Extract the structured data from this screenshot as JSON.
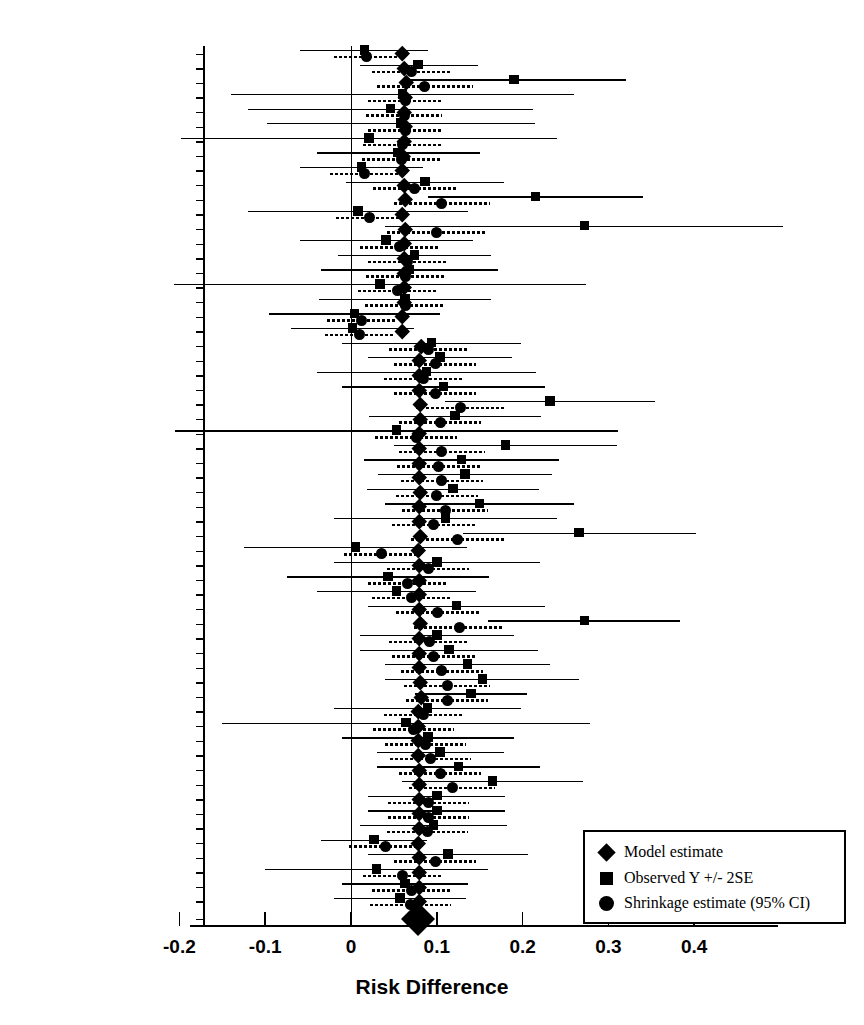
{
  "figure": {
    "type": "forest-plot",
    "xlabel": "Risk Difference"
  },
  "axis": {
    "ticks": [
      "-0.2",
      "-0.1",
      "0",
      "0.1",
      "0.2",
      "0.3",
      "0.4"
    ],
    "tick_values": [
      -0.2,
      -0.1,
      0,
      0.1,
      0.2,
      0.3,
      0.4
    ],
    "xlim": [
      -0.215,
      0.495
    ],
    "reference_line": 0
  },
  "legend": {
    "items": [
      {
        "marker": "diamond",
        "label": "Model estimate"
      },
      {
        "marker": "square",
        "label": "Observed Y +/- 2SE"
      },
      {
        "marker": "circle",
        "label": "Shrinkage estimate (95% CI)"
      }
    ]
  },
  "chart_data": {
    "type": "forest",
    "title": "",
    "xlabel": "Risk Difference",
    "ylabel": "",
    "xlim": [
      -0.215,
      0.495
    ],
    "grid": false,
    "legend_position": "bottom-right",
    "categories": [
      "BR THOR SOCIETY 1983",
      "RUSSELL 1983",
      "FAGERSTROM 1984",
      "JAMROZIK 1984",
      "JARVIK 1984",
      "CLAVEL-CHAPEL 1985",
      "SCHNEIDERa 1985",
      "PAGE 1986",
      "CAMPBELL 1987",
      "SUTTON 1987",
      "AREECHON 1988",
      "HARACKIEWICZ 1988",
      "LLIVINA 1988",
      "SUTTON 1988",
      "GILBERT 1989",
      "HUGHES 1989",
      "HUGHES 1990",
      "MORI 1992",
      "NEBOT 1992",
      "FORTMANN 1995",
      "PUSKA 1979",
      "MALCOLM 1980",
      "FAGERSTROM 1982",
      "FEE 1982",
      "JARVIS 1982",
      "HJALMARSON 1984",
      "KILLEN 1984",
      "SCHNEIDER 1985",
      "HALL 1987",
      "TONNESEN 1988",
      "BLONDAL 1989",
      "GARCIA 1989",
      "KILLEN 1990",
      "NAKAMURA 1990",
      "CAMPBELL 1991",
      "JENSEN 1991",
      "MCGOVERN 1992",
      "PIRIE 1992",
      "ZELMAN 1992",
      "HERRERA-1 1995",
      "ABELIN 1989",
      "DAUGHTON 1991",
      "TONNESEN 1991",
      "BURTON 1992",
      "PAOLETTI 1996",
      "BUCHKREMER 1981",
      "HURT 1990",
      "EHRSAM 1991",
      "TNSG 1991",
      "SACHS 1993",
      "WESTMAN 1993",
      "FIORE-1 1994",
      "FIORE-2 1994",
      "HURT 1994",
      "ICRF 1994",
      "RICHMOND 1994",
      "KORNITZER 1995",
      "STAPLETON 1995",
      "CAMPBELL 1996",
      "Overall"
    ],
    "series": [
      {
        "name": "Model estimate",
        "marker": "diamond",
        "values": [
          0.06,
          0.062,
          0.064,
          0.063,
          0.062,
          0.063,
          0.062,
          0.061,
          0.06,
          0.062,
          0.063,
          0.06,
          0.063,
          0.062,
          0.062,
          0.062,
          0.062,
          0.062,
          0.06,
          0.06,
          0.082,
          0.08,
          0.08,
          0.079,
          0.081,
          0.081,
          0.079,
          0.08,
          0.08,
          0.08,
          0.081,
          0.08,
          0.08,
          0.081,
          0.078,
          0.079,
          0.079,
          0.079,
          0.079,
          0.081,
          0.08,
          0.08,
          0.08,
          0.081,
          0.082,
          0.078,
          0.078,
          0.078,
          0.078,
          0.079,
          0.079,
          0.079,
          0.079,
          0.079,
          0.078,
          0.079,
          0.079,
          0.079,
          0.079,
          0.078
        ]
      },
      {
        "name": "Observed Y +/- 2SE",
        "marker": "square",
        "values": [
          0.016,
          0.078,
          0.19,
          0.06,
          0.046,
          0.058,
          0.021,
          0.055,
          0.012,
          0.086,
          0.215,
          0.008,
          0.272,
          0.041,
          0.074,
          0.068,
          0.034,
          0.063,
          0.004,
          0.002,
          0.094,
          0.104,
          0.088,
          0.108,
          0.232,
          0.121,
          0.053,
          0.18,
          0.129,
          0.133,
          0.119,
          0.15,
          0.11,
          0.266,
          0.005,
          0.1,
          0.043,
          0.053,
          0.123,
          0.272,
          0.1,
          0.114,
          0.136,
          0.153,
          0.14,
          0.089,
          0.064,
          0.09,
          0.104,
          0.125,
          0.165,
          0.1,
          0.1,
          0.096,
          0.027,
          0.113,
          0.03,
          0.063,
          0.057,
          0.077
        ],
        "ci_low": [
          -0.06,
          0.01,
          0.06,
          -0.14,
          -0.12,
          -0.098,
          -0.198,
          -0.04,
          -0.06,
          -0.006,
          0.09,
          -0.12,
          0.04,
          -0.06,
          -0.015,
          -0.035,
          -0.206,
          -0.037,
          -0.096,
          -0.07,
          -0.01,
          0.02,
          -0.04,
          -0.01,
          0.11,
          0.021,
          -0.205,
          0.05,
          0.015,
          0.032,
          0.019,
          0.04,
          -0.02,
          0.13,
          -0.125,
          -0.02,
          -0.075,
          -0.04,
          0.02,
          0.16,
          0.01,
          0.01,
          0.04,
          0.04,
          0.075,
          -0.02,
          -0.15,
          -0.01,
          0.03,
          0.03,
          0.06,
          0.02,
          0.02,
          0.01,
          -0.035,
          0.02,
          -0.1,
          -0.01,
          -0.02,
          0.055
        ],
        "ci_high": [
          0.09,
          0.148,
          0.32,
          0.26,
          0.212,
          0.214,
          0.24,
          0.15,
          0.084,
          0.178,
          0.34,
          0.136,
          0.504,
          0.142,
          0.163,
          0.171,
          0.274,
          0.163,
          0.104,
          0.074,
          0.198,
          0.188,
          0.216,
          0.226,
          0.354,
          0.221,
          0.311,
          0.31,
          0.243,
          0.234,
          0.219,
          0.26,
          0.24,
          0.402,
          0.135,
          0.22,
          0.161,
          0.146,
          0.226,
          0.384,
          0.19,
          0.218,
          0.232,
          0.266,
          0.205,
          0.198,
          0.278,
          0.19,
          0.178,
          0.22,
          0.27,
          0.18,
          0.18,
          0.182,
          0.089,
          0.206,
          0.16,
          0.136,
          0.134,
          0.099
        ]
      },
      {
        "name": "Shrinkage estimate (95% CI)",
        "marker": "circle",
        "values": [
          0.018,
          0.07,
          0.086,
          0.063,
          0.062,
          0.063,
          0.06,
          0.059,
          0.016,
          0.074,
          0.106,
          0.022,
          0.1,
          0.057,
          0.066,
          0.064,
          0.054,
          0.063,
          0.012,
          0.01,
          0.09,
          0.098,
          0.084,
          0.098,
          0.128,
          0.104,
          0.076,
          0.106,
          0.102,
          0.106,
          0.1,
          0.11,
          0.096,
          0.124,
          0.036,
          0.09,
          0.066,
          0.07,
          0.101,
          0.126,
          0.091,
          0.096,
          0.106,
          0.112,
          0.112,
          0.085,
          0.073,
          0.087,
          0.093,
          0.104,
          0.118,
          0.09,
          0.09,
          0.089,
          0.04,
          0.098,
          0.06,
          0.071,
          0.069,
          0.077
        ],
        "ci_low": [
          -0.02,
          0.024,
          0.03,
          0.02,
          0.018,
          0.02,
          0.014,
          0.013,
          -0.025,
          0.026,
          0.05,
          -0.018,
          0.042,
          0.01,
          0.02,
          0.018,
          0.008,
          0.016,
          -0.028,
          -0.03,
          0.044,
          0.05,
          0.038,
          0.05,
          0.076,
          0.056,
          0.028,
          0.056,
          0.054,
          0.058,
          0.052,
          0.06,
          0.048,
          0.07,
          -0.008,
          0.042,
          0.02,
          0.024,
          0.053,
          0.074,
          0.044,
          0.048,
          0.058,
          0.062,
          0.064,
          0.038,
          0.026,
          0.04,
          0.046,
          0.056,
          0.068,
          0.043,
          0.043,
          0.042,
          -0.002,
          0.05,
          0.014,
          0.024,
          0.022,
          0.056
        ],
        "ci_high": [
          0.056,
          0.116,
          0.142,
          0.106,
          0.106,
          0.106,
          0.106,
          0.105,
          0.057,
          0.122,
          0.162,
          0.062,
          0.158,
          0.104,
          0.112,
          0.11,
          0.1,
          0.11,
          0.052,
          0.05,
          0.136,
          0.146,
          0.13,
          0.146,
          0.18,
          0.152,
          0.124,
          0.156,
          0.15,
          0.154,
          0.148,
          0.16,
          0.144,
          0.178,
          0.08,
          0.138,
          0.112,
          0.116,
          0.149,
          0.178,
          0.138,
          0.144,
          0.154,
          0.162,
          0.16,
          0.132,
          0.12,
          0.134,
          0.14,
          0.152,
          0.168,
          0.137,
          0.137,
          0.136,
          0.082,
          0.146,
          0.106,
          0.118,
          0.116,
          0.098
        ]
      }
    ],
    "overall": {
      "label": "Overall",
      "value": 0.078,
      "marker": "diamond-large"
    }
  }
}
